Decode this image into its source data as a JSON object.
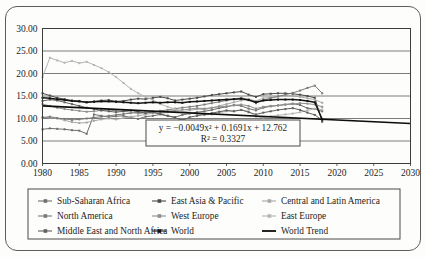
{
  "chart_data": {
    "type": "line",
    "title": "",
    "subtitle": "",
    "xlabel": "",
    "ylabel": "",
    "xlim": [
      1980,
      2030
    ],
    "ylim": [
      0,
      30
    ],
    "xticks": [
      "1980",
      "1985",
      "1990",
      "1995",
      "2000",
      "2005",
      "2010",
      "2015",
      "2020",
      "2025",
      "2030"
    ],
    "yticks": [
      "0.00",
      "5.00",
      "10.00",
      "15.00",
      "20.00",
      "25.00",
      "30.00"
    ],
    "grid": "horizontal",
    "legend_position": "bottom",
    "annotation": {
      "equation": "y = −0.0049x² + 0.1691x + 12.762",
      "r_squared": "R² = 0.3327"
    },
    "series": [
      {
        "name": "Sub-Saharan Africa",
        "color": "#6f6f6f",
        "x": [
          1980,
          1981,
          1982,
          1983,
          1984,
          1985,
          1986,
          1987,
          1988,
          1989,
          1990,
          1991,
          1992,
          1993,
          1994,
          1995,
          1996,
          1997,
          1998,
          1999,
          2000,
          2001,
          2002,
          2003,
          2004,
          2005,
          2006,
          2007,
          2008,
          2009,
          2010,
          2011,
          2012,
          2013,
          2014,
          2015,
          2016,
          2017,
          2018
        ],
        "values": [
          7.6,
          7.8,
          7.7,
          7.6,
          7.4,
          7.3,
          6.6,
          10.9,
          10.6,
          10.3,
          10.5,
          10.6,
          10.2,
          9.9,
          10.4,
          10.6,
          10.9,
          10.6,
          10.3,
          10.8,
          11.1,
          11.4,
          11.6,
          11.9,
          12.3,
          12.6,
          13.0,
          12.8,
          12.2,
          11.8,
          12.4,
          12.7,
          12.9,
          13.1,
          13.3,
          13.0,
          12.3,
          12.1,
          11.6
        ]
      },
      {
        "name": "East Asia & Pacific",
        "color": "#4a4a4a",
        "x": [
          1980,
          1981,
          1982,
          1983,
          1984,
          1985,
          1986,
          1987,
          1988,
          1989,
          1990,
          1991,
          1992,
          1993,
          1994,
          1995,
          1996,
          1997,
          1998,
          1999,
          2000,
          2001,
          2002,
          2003,
          2004,
          2005,
          2006,
          2007,
          2008,
          2009,
          2010,
          2011,
          2012,
          2013,
          2014,
          2015,
          2016,
          2017,
          2018
        ],
        "values": [
          15.6,
          15.1,
          14.6,
          14.3,
          14.0,
          13.9,
          13.6,
          13.8,
          14.0,
          14.1,
          13.8,
          13.9,
          14.2,
          14.4,
          14.3,
          14.6,
          14.8,
          14.5,
          14.0,
          14.2,
          14.4,
          14.6,
          14.9,
          15.2,
          15.4,
          15.6,
          15.8,
          16.0,
          15.3,
          14.8,
          15.4,
          15.5,
          15.6,
          15.6,
          15.5,
          15.3,
          15.0,
          14.6,
          9.3
        ]
      },
      {
        "name": "Central and Latin America",
        "color": "#a8a8a8",
        "x": [
          1980,
          1981,
          1982,
          1983,
          1984,
          1985,
          1986,
          1987,
          1988,
          1989,
          1990,
          1991,
          1992,
          1993,
          1994,
          1995,
          1996,
          1997,
          1998,
          1999,
          2000,
          2001,
          2002,
          2003,
          2004,
          2005,
          2006,
          2007,
          2008,
          2009,
          2010,
          2011,
          2012,
          2013,
          2014,
          2015,
          2016,
          2017,
          2018
        ],
        "values": [
          10.3,
          10.2,
          10.0,
          9.6,
          9.2,
          9.0,
          9.1,
          9.5,
          9.8,
          10.0,
          9.8,
          10.1,
          10.4,
          10.6,
          10.9,
          11.2,
          11.1,
          11.4,
          11.6,
          11.4,
          11.8,
          12.1,
          12.0,
          12.3,
          12.8,
          13.2,
          13.6,
          14.0,
          14.3,
          13.9,
          14.5,
          14.7,
          14.9,
          15.1,
          15.0,
          14.8,
          14.5,
          14.2,
          13.5
        ]
      },
      {
        "name": "North America",
        "color": "#7a7a7a",
        "x": [
          1980,
          1981,
          1982,
          1983,
          1984,
          1985,
          1986,
          1987,
          1988,
          1989,
          1990,
          1991,
          1992,
          1993,
          1994,
          1995,
          1996,
          1997,
          1998,
          1999,
          2000,
          2001,
          2002,
          2003,
          2004,
          2005,
          2006,
          2007,
          2008,
          2009,
          2010,
          2011,
          2012,
          2013,
          2014,
          2015,
          2016,
          2017,
          2018
        ],
        "values": [
          10.2,
          10.4,
          10.1,
          9.9,
          9.7,
          9.8,
          10.0,
          10.2,
          10.4,
          10.6,
          10.8,
          11.0,
          11.2,
          11.4,
          11.3,
          11.5,
          11.7,
          11.9,
          12.2,
          12.4,
          12.6,
          12.8,
          13.1,
          13.4,
          13.7,
          14.0,
          14.3,
          14.6,
          14.2,
          13.4,
          14.1,
          14.5,
          14.9,
          15.3,
          15.7,
          16.2,
          16.8,
          17.3,
          15.6
        ]
      },
      {
        "name": "West Europe",
        "color": "#8e8e8e",
        "x": [
          1980,
          1981,
          1982,
          1983,
          1984,
          1985,
          1986,
          1987,
          1988,
          1989,
          1990,
          1991,
          1992,
          1993,
          1994,
          1995,
          1996,
          1997,
          1998,
          1999,
          2000,
          2001,
          2002,
          2003,
          2004,
          2005,
          2006,
          2007,
          2008,
          2009,
          2010,
          2011,
          2012,
          2013,
          2014,
          2015,
          2016,
          2017,
          2018
        ],
        "values": [
          13.2,
          12.8,
          12.4,
          12.1,
          11.9,
          11.7,
          11.5,
          11.6,
          11.8,
          11.9,
          11.7,
          11.6,
          11.4,
          11.1,
          11.3,
          11.5,
          11.4,
          11.6,
          11.8,
          11.9,
          12.1,
          12.3,
          12.2,
          12.4,
          12.6,
          12.7,
          12.9,
          13.1,
          12.8,
          12.2,
          12.6,
          12.8,
          12.9,
          13.1,
          13.2,
          13.4,
          13.3,
          13.1,
          12.6
        ]
      },
      {
        "name": "East Europe",
        "color": "#b5b5b5",
        "x": [
          1980,
          1981,
          1982,
          1983,
          1984,
          1985,
          1986,
          1987,
          1988,
          1989,
          1990,
          1991,
          1992,
          1993,
          1994,
          1995,
          1996,
          1997,
          1998,
          1999,
          2000,
          2001,
          2002,
          2003,
          2004,
          2005,
          2006,
          2007,
          2008,
          2009,
          2010,
          2011,
          2012,
          2013,
          2014,
          2015,
          2016,
          2017,
          2018
        ],
        "values": [
          19.2,
          23.5,
          22.9,
          22.4,
          22.8,
          22.3,
          22.6,
          21.9,
          21.2,
          20.3,
          19.2,
          17.9,
          16.6,
          15.6,
          14.8,
          14.1,
          13.2,
          12.6,
          12.1,
          11.6,
          11.2,
          11.0,
          10.8,
          10.9,
          11.3,
          11.6,
          11.7,
          11.9,
          11.6,
          10.4,
          10.2,
          10.5,
          10.7,
          10.9,
          11.1,
          11.4,
          11.8,
          12.2,
          12.0
        ]
      },
      {
        "name": "Middle East and North Africa",
        "color": "#606060",
        "x": [
          1980,
          1981,
          1982,
          1983,
          1984,
          1985,
          1986,
          1987,
          1988,
          1989,
          1990,
          1991,
          1992,
          1993,
          1994,
          1995,
          1996,
          1997,
          1998,
          1999,
          2000,
          2001,
          2002,
          2003,
          2004,
          2005,
          2006,
          2007,
          2008,
          2009,
          2010,
          2011,
          2012,
          2013,
          2014,
          2015,
          2016,
          2017,
          2018
        ],
        "values": [
          13.9,
          14.2,
          14.0,
          13.6,
          13.2,
          12.8,
          12.4,
          12.1,
          11.8,
          11.6,
          11.4,
          11.6,
          11.8,
          11.5,
          11.2,
          11.4,
          11.0,
          10.6,
          10.2,
          9.6,
          10.3,
          10.6,
          10.9,
          11.2,
          11.5,
          11.8,
          11.6,
          11.9,
          11.4,
          10.9,
          11.3,
          11.6,
          11.9,
          12.1,
          12.3,
          11.9,
          11.3,
          10.8,
          9.6
        ]
      },
      {
        "name": "World",
        "color": "#141414",
        "x": [
          1980,
          1981,
          1982,
          1983,
          1984,
          1985,
          1986,
          1987,
          1988,
          1989,
          1990,
          1991,
          1992,
          1993,
          1994,
          1995,
          1996,
          1997,
          1998,
          1999,
          2000,
          2001,
          2002,
          2003,
          2004,
          2005,
          2006,
          2007,
          2008,
          2009,
          2010,
          2011,
          2012,
          2013,
          2014,
          2015,
          2016,
          2017,
          2018
        ],
        "values": [
          14.6,
          14.5,
          14.3,
          14.1,
          13.9,
          13.8,
          13.6,
          13.7,
          13.8,
          13.8,
          13.7,
          13.6,
          13.5,
          13.4,
          13.5,
          13.6,
          13.5,
          13.6,
          13.6,
          13.5,
          13.7,
          13.8,
          13.9,
          14.0,
          14.1,
          14.2,
          14.3,
          14.4,
          14.1,
          13.6,
          14.0,
          14.1,
          14.2,
          14.2,
          14.2,
          14.1,
          13.9,
          13.6,
          9.8
        ]
      }
    ],
    "trend": {
      "name": "World Trend",
      "color": "#0d0d0d",
      "x": [
        1980,
        2030
      ],
      "values": [
        12.8,
        8.9
      ],
      "equation": "y = −0.0049x² + 0.1691x + 12.762",
      "r_squared": 0.3327
    }
  },
  "legend": {
    "rows": [
      [
        {
          "label": "Sub-Saharan Africa",
          "color": "#6f6f6f"
        },
        {
          "label": "East Asia & Pacific",
          "color": "#4a4a4a"
        },
        {
          "label": "Central and Latin America",
          "color": "#a8a8a8"
        }
      ],
      [
        {
          "label": "North America",
          "color": "#7a7a7a"
        },
        {
          "label": "West Europe",
          "color": "#8e8e8e"
        },
        {
          "label": "East Europe",
          "color": "#b5b5b5"
        }
      ],
      [
        {
          "label": "Middle East and North Africa",
          "color": "#606060"
        },
        {
          "label": "World",
          "color": "#141414"
        },
        {
          "label": "World Trend",
          "color": "#0d0d0d"
        }
      ]
    ]
  }
}
